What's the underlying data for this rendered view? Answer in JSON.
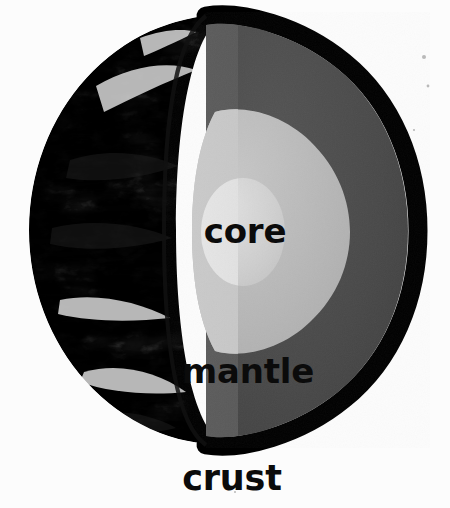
{
  "diagram": {
    "background_color": "#fcfcfc",
    "labels": {
      "core": "core",
      "mantle": "mantle",
      "crust": "crust"
    },
    "layers": [
      {
        "name": "crust",
        "label": "crust",
        "color": "#000000",
        "description": "thin black outer shell drawn around the cut hemisphere"
      },
      {
        "name": "mantle",
        "label": "mantle",
        "color": "#4b4b4b",
        "cut_face_color": "#555555",
        "description": "thick dark grey layer between crust and core"
      },
      {
        "name": "outer-core",
        "label": "core",
        "color": "#b9b9b9",
        "cut_face_color": "#c4c4c4",
        "description": "light grey rounded region inside the mantle"
      },
      {
        "name": "inner-core",
        "label": "core",
        "color": "#d8d8d8",
        "cut_face_color": "#e2e2e2",
        "description": "lightest small sphere at the very centre"
      },
      {
        "name": "surface-photo",
        "label": "",
        "color": "#8a8a8a",
        "description": "greyscale satellite photograph of Earth's cloudy surface on the left hemisphere"
      }
    ],
    "label_color": "#0b0b0b",
    "geometry": {
      "sphere_center_x": 225,
      "sphere_center_y": 230,
      "sphere_radius_x": 196,
      "sphere_radius_y": 215,
      "cut_plane_x": 178
    }
  }
}
